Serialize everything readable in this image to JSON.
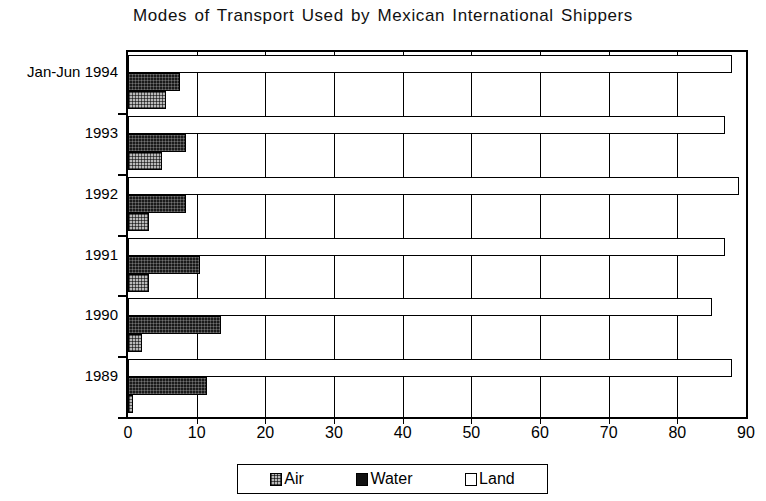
{
  "chart_data": {
    "type": "bar",
    "orientation": "horizontal",
    "title": "Modes of Transport Used by Mexican International Shippers",
    "xlabel": "",
    "ylabel": "",
    "xlim": [
      0,
      90
    ],
    "xticks": [
      "0",
      "10",
      "20",
      "30",
      "40",
      "50",
      "60",
      "70",
      "80",
      "90"
    ],
    "xtick_step": 10,
    "grid": true,
    "grid_axis": "x",
    "legend_position": "bottom",
    "categories": [
      "Jan-Jun 1994",
      "1993",
      "1992",
      "1991",
      "1990",
      "1989"
    ],
    "series": [
      {
        "name": "Air",
        "values": [
          5.5,
          5.0,
          3.0,
          3.0,
          2.0,
          0.7
        ]
      },
      {
        "name": "Water",
        "values": [
          7.5,
          8.5,
          8.5,
          10.5,
          13.5,
          11.5
        ]
      },
      {
        "name": "Land",
        "values": [
          88.0,
          87.0,
          89.0,
          87.0,
          85.0,
          88.0
        ]
      }
    ],
    "series_colors": {
      "Air": "#b9b9b9",
      "Water": "#1a1a1a",
      "Land": "#ffffff"
    }
  },
  "legend": {
    "items": [
      {
        "label": "Air",
        "swatch": "air-swatch-icon"
      },
      {
        "label": "Water",
        "swatch": "water-swatch-icon"
      },
      {
        "label": "Land",
        "swatch": "land-swatch-icon"
      }
    ]
  }
}
